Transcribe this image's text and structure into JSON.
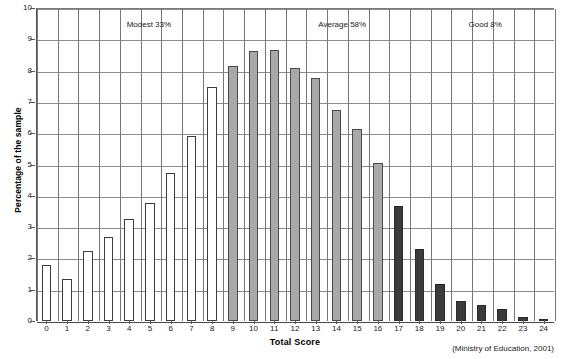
{
  "chart_data": {
    "type": "bar",
    "title": "",
    "xlabel": "Total Score",
    "ylabel": "Percentage of the sample",
    "ylim": [
      0,
      10
    ],
    "ytick_step": 1,
    "grid": "horizontal-and-vertical",
    "legend": "none",
    "categories": [
      "0",
      "1",
      "2",
      "3",
      "4",
      "5",
      "6",
      "7",
      "8",
      "9",
      "10",
      "11",
      "12",
      "13",
      "14",
      "15",
      "16",
      "17",
      "18",
      "19",
      "20",
      "21",
      "22",
      "23",
      "24"
    ],
    "values": [
      1.8,
      1.33,
      2.23,
      2.68,
      3.25,
      3.77,
      4.72,
      5.92,
      7.48,
      8.15,
      8.63,
      8.65,
      8.07,
      7.75,
      6.75,
      6.12,
      5.05,
      3.68,
      2.3,
      1.18,
      0.65,
      0.5,
      0.38,
      0.12,
      0.08
    ],
    "y_tick_labels": [
      "0",
      "1",
      "2",
      "3",
      "4",
      "5",
      "6",
      "7",
      "8",
      "9",
      "10"
    ],
    "bar_groups": [
      {
        "name": "Modest",
        "color": "#ffffff",
        "edge": "#3c3c3c",
        "from_index": 0,
        "to_index": 8
      },
      {
        "name": "Average",
        "color": "#a9a9a9",
        "edge": "#4a4a4a",
        "from_index": 9,
        "to_index": 16
      },
      {
        "name": "Good",
        "color": "#3a3a3a",
        "edge": "#2a2a2a",
        "from_index": 17,
        "to_index": 24
      }
    ],
    "annotations": [
      {
        "label": "Modest 33%",
        "x_fraction": 0.175
      },
      {
        "label": "Average 58%",
        "x_fraction": 0.545
      },
      {
        "label": "Good 8%",
        "x_fraction": 0.835
      }
    ],
    "source_note": "(Ministry of Education, 2001)"
  }
}
